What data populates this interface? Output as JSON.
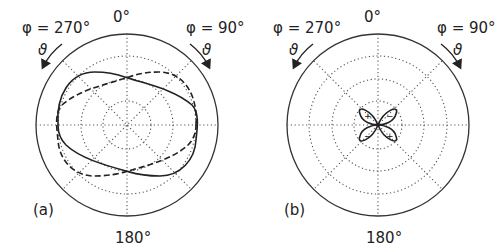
{
  "panels": [
    {
      "id": "a",
      "label": "(a)",
      "top_label": "0°",
      "bottom_label": "180°",
      "left_label": "φ = 270°",
      "right_label": "φ = 90°",
      "theta_symbol": "ϑ",
      "center": [
        127,
        125
      ],
      "outer_radius": 91,
      "grid_radii": [
        24,
        46,
        69
      ],
      "curves": [
        "solid-lobe",
        "dashed-lobe"
      ]
    },
    {
      "id": "b",
      "label": "(b)",
      "top_label": "0°",
      "bottom_label": "180°",
      "left_label": "φ = 270°",
      "right_label": "φ = 90°",
      "theta_symbol": "ϑ",
      "center": [
        378,
        125
      ],
      "outer_radius": 91,
      "grid_radii": [
        24,
        46,
        69
      ],
      "lobe_signs": [
        "+",
        "−",
        "−",
        "+"
      ]
    }
  ],
  "colors": {
    "line": "#222222",
    "grid": "#555555",
    "background": "#ffffff"
  }
}
